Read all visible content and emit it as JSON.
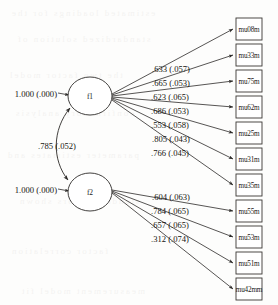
{
  "diagram": {
    "type": "sem-path-diagram",
    "background_color": "#fdfdfc",
    "line_color": "#2c2a28",
    "factors": [
      {
        "id": "f1",
        "label": "f1",
        "cx": 90,
        "cy": 96,
        "rx": 22,
        "ry": 19
      },
      {
        "id": "f2",
        "label": "f2",
        "cx": 90,
        "cy": 192,
        "rx": 22,
        "ry": 19
      }
    ],
    "indicators": [
      {
        "id": "i1",
        "label": "mu08m",
        "factor": "f1",
        "x": 236,
        "y": 18
      },
      {
        "id": "i2",
        "label": "mu33m",
        "factor": "f1",
        "x": 236,
        "y": 44
      },
      {
        "id": "i3",
        "label": "mu75m",
        "factor": "f1",
        "x": 236,
        "y": 70
      },
      {
        "id": "i4",
        "label": "mu62m",
        "factor": "f1",
        "x": 236,
        "y": 96
      },
      {
        "id": "i5",
        "label": "mu25m",
        "factor": "f1",
        "x": 236,
        "y": 122
      },
      {
        "id": "i6",
        "label": "mu31m",
        "factor": "f1",
        "x": 236,
        "y": 148
      },
      {
        "id": "i7",
        "label": "mu35m",
        "factor": "f1",
        "x": 236,
        "y": 174
      },
      {
        "id": "i8",
        "label": "mu55m",
        "factor": "f2",
        "x": 236,
        "y": 200
      },
      {
        "id": "i9",
        "label": "mu53m",
        "factor": "f2",
        "x": 236,
        "y": 226
      },
      {
        "id": "i10",
        "label": "mu51m",
        "factor": "f2",
        "x": 236,
        "y": 252
      },
      {
        "id": "i11",
        "label": "mu42mm",
        "factor": "f2",
        "x": 236,
        "y": 278
      }
    ],
    "box_size": {
      "width": 26,
      "height": 22
    },
    "loadings_f1": [
      {
        "target": "mu08m",
        "estimate": ".633",
        "se": "(.057)",
        "text": ".633 (.057)"
      },
      {
        "target": "mu33m",
        "estimate": ".665",
        "se": "(.053)",
        "text": ".665 (.053)"
      },
      {
        "target": "mu75m",
        "estimate": ".623",
        "se": "(.065)",
        "text": ".623 (.065)"
      },
      {
        "target": "mu62m",
        "estimate": ".686",
        "se": "(.053)",
        "text": ".686 (.053)"
      },
      {
        "target": "mu25m",
        "estimate": ".553",
        "se": "(.058)",
        "text": ".553 (.058)"
      },
      {
        "target": "mu31m",
        "estimate": ".805",
        "se": "(.043)",
        "text": ".805 (.043)"
      },
      {
        "target": "mu35m",
        "estimate": ".766",
        "se": "(.045)",
        "text": ".766 (.045)"
      }
    ],
    "loadings_f2": [
      {
        "target": "mu55m",
        "estimate": ".604",
        "se": "(.063)",
        "text": ".604 (.063)"
      },
      {
        "target": "mu53m",
        "estimate": ".784",
        "se": "(.065)",
        "text": ".784 (.065)"
      },
      {
        "target": "mu51m",
        "estimate": ".657",
        "se": "(.065)",
        "text": ".657 (.065)"
      },
      {
        "target": "mu42mm",
        "estimate": ".312",
        "se": "(.074)",
        "text": ".312 (.074)"
      }
    ],
    "variances": [
      {
        "for": "f1",
        "estimate": "1.000",
        "se": "(.000)",
        "text": "1.000 (.000)"
      },
      {
        "for": "f2",
        "estimate": "1.000",
        "se": "(.000)",
        "text": "1.000 (.000)"
      }
    ],
    "covariance": {
      "between": "f1-f2",
      "estimate": ".785",
      "se": "(.052)",
      "text": ".785 (.052)"
    }
  },
  "ghost_text": {
    "rows": [
      "estimated loadings for the",
      "standardized solution of",
      "the two factor model",
      "confirmatory analysis",
      "parameter estimates and",
      "standard errors shown",
      "factor correlation",
      "measurement model fit"
    ]
  }
}
